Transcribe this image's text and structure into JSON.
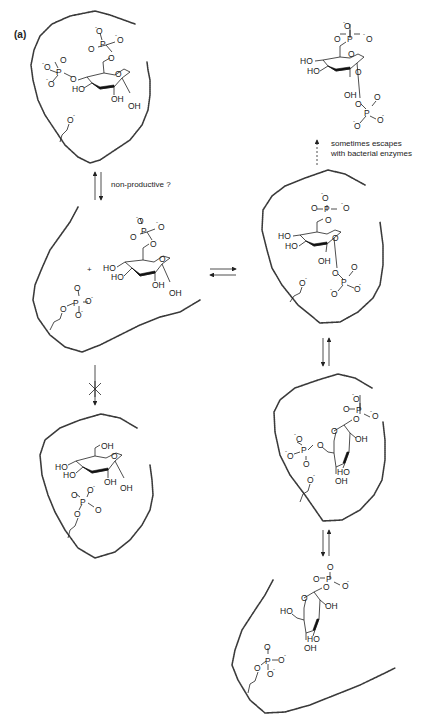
{
  "figure": {
    "panel_label": "(a)",
    "annotations": {
      "non_productive": "non-productive ?",
      "escape_line1": "sometimes escapes",
      "escape_line2": "with bacterial enzymes"
    },
    "atoms": {
      "O": "O",
      "P": "P",
      "HO": "HO",
      "OH": "OH",
      "O_minus": "O",
      "minus": "-",
      "plus": "+"
    },
    "states": [
      {
        "id": "enzyme-bisphosphate-complex",
        "description": "glucose 1,6-bisphosphate bound with enzyme alkoxide (4,6-bisphosphate orientation)"
      },
      {
        "id": "phosphoenzyme-plus-g6p",
        "description": "phosphoenzyme + glucose 6-phosphate"
      },
      {
        "id": "blocked-glucose-complex",
        "description": "glucose bound to phosphoenzyme (blocked)"
      },
      {
        "id": "enzyme-g16bp-complex",
        "description": "enzyme alkoxide with glucose 1,6-bisphosphate"
      },
      {
        "id": "free-g16bp",
        "description": "released glucose 1,6-bisphosphate"
      },
      {
        "id": "rotated-g16bp-complex",
        "description": "reoriented glucose 1,6-bisphosphate in enzyme"
      },
      {
        "id": "phosphoenzyme-plus-g1p",
        "description": "phosphoenzyme + glucose 1-phosphate"
      }
    ],
    "arrows": [
      {
        "from": "enzyme-bisphosphate-complex",
        "to": "phosphoenzyme-plus-g6p",
        "type": "equilibrium",
        "label_key": "non_productive"
      },
      {
        "from": "phosphoenzyme-plus-g6p",
        "to": "enzyme-g16bp-complex",
        "type": "equilibrium"
      },
      {
        "from": "phosphoenzyme-plus-g6p",
        "to": "blocked-glucose-complex",
        "type": "blocked"
      },
      {
        "from": "enzyme-g16bp-complex",
        "to": "free-g16bp",
        "type": "dashed",
        "label_key": "escape"
      },
      {
        "from": "enzyme-g16bp-complex",
        "to": "rotated-g16bp-complex",
        "type": "equilibrium"
      },
      {
        "from": "rotated-g16bp-complex",
        "to": "phosphoenzyme-plus-g1p",
        "type": "equilibrium"
      }
    ]
  }
}
